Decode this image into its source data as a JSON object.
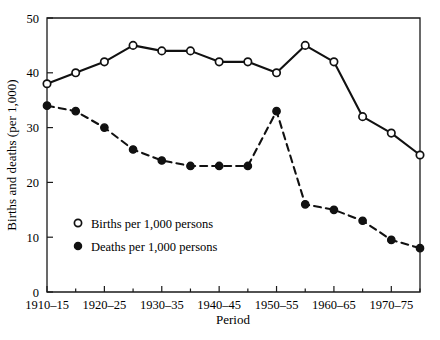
{
  "chart_data": {
    "type": "line",
    "title": "",
    "xlabel": "Period",
    "ylabel": "Births and deaths (per 1,000)",
    "xlim": [
      1910,
      1975
    ],
    "ylim": [
      0,
      50
    ],
    "grid": false,
    "legend_position": "inside-lower-left",
    "x": [
      1910,
      1915,
      1920,
      1925,
      1930,
      1935,
      1940,
      1945,
      1950,
      1955,
      1960,
      1965,
      1970,
      1975
    ],
    "x_tick_labels": [
      "1910–15",
      "1920–25",
      "1930–35",
      "1940–45",
      "1950–55",
      "1960–65",
      "1970–75"
    ],
    "x_tick_values": [
      1910,
      1920,
      1930,
      1940,
      1950,
      1960,
      1970
    ],
    "x_minor_tick_values": [
      1915,
      1925,
      1935,
      1945,
      1955,
      1965,
      1975
    ],
    "y_tick_labels": [
      "0",
      "10",
      "20",
      "30",
      "40",
      "50"
    ],
    "y_tick_values": [
      0,
      10,
      20,
      30,
      40,
      50
    ],
    "series": [
      {
        "name": "Births per 1,000 persons",
        "marker": "open-circle",
        "linestyle": "solid",
        "color": "#111111",
        "values": [
          38,
          40,
          42,
          45,
          44,
          44,
          42,
          42,
          40,
          45,
          42,
          32,
          29,
          25
        ]
      },
      {
        "name": "Deaths per 1,000 persons",
        "marker": "filled-circle",
        "linestyle": "dashed",
        "color": "#111111",
        "values": [
          34,
          33,
          30,
          26,
          24,
          23,
          23,
          23,
          33,
          16,
          15,
          13,
          9.5,
          8
        ]
      }
    ]
  },
  "axes": {
    "x_title": "Period",
    "y_title": "Births and deaths (per 1,000)"
  },
  "legend": {
    "entries": [
      {
        "label": "Births per 1,000 persons",
        "marker": "open-circle"
      },
      {
        "label": "Deaths per 1,000 persons",
        "marker": "filled-circle"
      }
    ]
  },
  "colors": {
    "ink": "#111111",
    "frame": "#1a1a1a",
    "background": "#ffffff"
  }
}
